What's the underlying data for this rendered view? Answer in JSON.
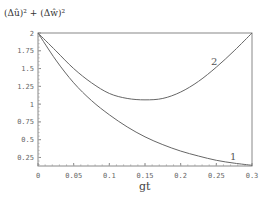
{
  "chart_data": {
    "type": "line",
    "title": "",
    "xlabel": "gt",
    "ylabel": "(Δû)² + (Δŵ)²",
    "xlim": [
      0,
      0.3
    ],
    "ylim": [
      0.13,
      2
    ],
    "x_ticks": [
      "0",
      "0.05",
      "0.1",
      "0.15",
      "0.2",
      "0.25",
      "0.3"
    ],
    "y_ticks": [
      "0.25",
      "0.5",
      "0.75",
      "1",
      "1.25",
      "1.5",
      "1.75",
      "2"
    ],
    "grid": false,
    "legend": "none; curves labeled inline with 1 and 2",
    "series": [
      {
        "name": "1",
        "x": [
          0,
          0.025,
          0.05,
          0.075,
          0.1,
          0.125,
          0.15,
          0.175,
          0.2,
          0.225,
          0.25,
          0.275,
          0.3
        ],
        "y": [
          2.0,
          1.62,
          1.3,
          1.05,
          0.85,
          0.68,
          0.54,
          0.43,
          0.34,
          0.27,
          0.21,
          0.17,
          0.14
        ]
      },
      {
        "name": "2",
        "x": [
          0,
          0.025,
          0.05,
          0.075,
          0.1,
          0.125,
          0.15,
          0.175,
          0.2,
          0.225,
          0.25,
          0.275,
          0.3
        ],
        "y": [
          2.0,
          1.75,
          1.5,
          1.3,
          1.15,
          1.08,
          1.06,
          1.08,
          1.17,
          1.32,
          1.52,
          1.75,
          2.0
        ]
      }
    ]
  },
  "labels": {
    "ytitle": "(Δû)² + (Δŵ)²",
    "xtitle": "gt",
    "curve1": "1",
    "curve2": "2"
  }
}
